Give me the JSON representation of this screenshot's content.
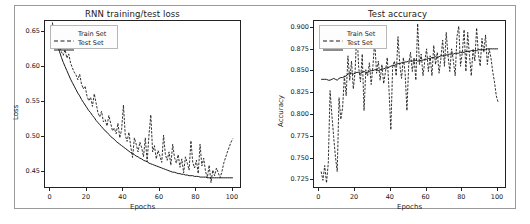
{
  "figure": {
    "background": "#ffffff",
    "border_color": "#9a9a9a",
    "line_color": "#1a1a1a"
  },
  "charts": [
    {
      "id": "loss-chart",
      "title": "RNN training/test loss",
      "xlabel": "Epochs",
      "ylabel": "Loss",
      "xticks": [
        "0",
        "20",
        "40",
        "60",
        "80",
        "100"
      ],
      "yticks": [
        "0.65",
        "0.60",
        "0.55",
        "0.50",
        "0.45"
      ],
      "legend": [
        {
          "label": "Train Set",
          "style": "dashed"
        },
        {
          "label": "Test Set",
          "style": "solid"
        }
      ]
    },
    {
      "id": "accuracy-chart",
      "title": "Test accuracy",
      "xlabel": "Epochs",
      "ylabel": "Accuracy",
      "xticks": [
        "0",
        "20",
        "40",
        "60",
        "80",
        "100"
      ],
      "yticks": [
        "0.900",
        "0.875",
        "0.850",
        "0.825",
        "0.800",
        "0.775",
        "0.750",
        "0.725"
      ],
      "legend": [
        {
          "label": "Train Set",
          "style": "dashed"
        },
        {
          "label": "Test Set",
          "style": "solid"
        }
      ]
    }
  ],
  "chart_data": [
    {
      "type": "line",
      "title": "RNN training/test loss",
      "xlabel": "Epochs",
      "ylabel": "Loss",
      "xlim": [
        -3,
        105
      ],
      "ylim": [
        0.425,
        0.665
      ],
      "grid": false,
      "legend_position": "upper left",
      "x": [
        1,
        2,
        3,
        4,
        5,
        6,
        7,
        8,
        9,
        10,
        11,
        12,
        13,
        14,
        15,
        16,
        17,
        18,
        19,
        20,
        21,
        22,
        23,
        24,
        25,
        26,
        27,
        28,
        29,
        30,
        31,
        32,
        33,
        34,
        35,
        36,
        37,
        38,
        39,
        40,
        41,
        42,
        43,
        44,
        45,
        46,
        47,
        48,
        49,
        50,
        51,
        52,
        53,
        54,
        55,
        56,
        57,
        58,
        59,
        60,
        61,
        62,
        63,
        64,
        65,
        66,
        67,
        68,
        69,
        70,
        71,
        72,
        73,
        74,
        75,
        76,
        77,
        78,
        79,
        80,
        81,
        82,
        83,
        84,
        85,
        86,
        87,
        88,
        89,
        90,
        91,
        92,
        93,
        94,
        95,
        96,
        97,
        98,
        99,
        100
      ],
      "series": [
        {
          "name": "Train Set",
          "style": "dashed",
          "values": [
            0.663,
            0.651,
            0.642,
            0.634,
            0.627,
            0.621,
            0.616,
            0.624,
            0.612,
            0.618,
            0.605,
            0.598,
            0.592,
            0.588,
            0.581,
            0.589,
            0.575,
            0.568,
            0.572,
            0.558,
            0.551,
            0.556,
            0.543,
            0.561,
            0.548,
            0.534,
            0.528,
            0.536,
            0.521,
            0.524,
            0.515,
            0.53,
            0.519,
            0.508,
            0.512,
            0.504,
            0.519,
            0.498,
            0.51,
            0.545,
            0.502,
            0.493,
            0.506,
            0.486,
            0.47,
            0.498,
            0.489,
            0.478,
            0.492,
            0.484,
            0.471,
            0.498,
            0.464,
            0.502,
            0.531,
            0.478,
            0.487,
            0.468,
            0.48,
            0.472,
            0.463,
            0.502,
            0.474,
            0.466,
            0.478,
            0.459,
            0.489,
            0.47,
            0.462,
            0.474,
            0.456,
            0.468,
            0.448,
            0.471,
            0.462,
            0.452,
            0.494,
            0.463,
            0.455,
            0.466,
            0.447,
            0.489,
            0.458,
            0.469,
            0.45,
            0.441,
            0.459,
            0.434,
            0.452,
            0.444,
            0.455,
            0.448,
            0.441,
            0.45,
            0.462,
            0.47,
            0.478,
            0.485,
            0.492,
            0.497
          ]
        },
        {
          "name": "Test Set",
          "style": "solid",
          "values": [
            0.66,
            0.648,
            0.638,
            0.629,
            0.621,
            0.613,
            0.606,
            0.6,
            0.594,
            0.588,
            0.582,
            0.577,
            0.572,
            0.567,
            0.562,
            0.558,
            0.553,
            0.549,
            0.545,
            0.541,
            0.537,
            0.534,
            0.53,
            0.527,
            0.523,
            0.52,
            0.517,
            0.514,
            0.511,
            0.508,
            0.506,
            0.503,
            0.5,
            0.498,
            0.496,
            0.493,
            0.491,
            0.489,
            0.487,
            0.485,
            0.483,
            0.481,
            0.479,
            0.477,
            0.476,
            0.474,
            0.472,
            0.471,
            0.469,
            0.468,
            0.466,
            0.465,
            0.464,
            0.462,
            0.461,
            0.46,
            0.459,
            0.458,
            0.457,
            0.456,
            0.455,
            0.454,
            0.453,
            0.452,
            0.451,
            0.45,
            0.449,
            0.449,
            0.448,
            0.447,
            0.447,
            0.446,
            0.446,
            0.445,
            0.445,
            0.444,
            0.444,
            0.444,
            0.443,
            0.443,
            0.443,
            0.442,
            0.442,
            0.442,
            0.442,
            0.441,
            0.441,
            0.441,
            0.441,
            0.441,
            0.441,
            0.441,
            0.441,
            0.441,
            0.441,
            0.441,
            0.441,
            0.441,
            0.441,
            0.441
          ]
        }
      ]
    },
    {
      "type": "line",
      "title": "Test accuracy",
      "xlabel": "Epochs",
      "ylabel": "Accuracy",
      "xlim": [
        -3,
        105
      ],
      "ylim": [
        0.715,
        0.908
      ],
      "grid": false,
      "legend_position": "upper left",
      "x": [
        1,
        2,
        3,
        4,
        5,
        6,
        7,
        8,
        9,
        10,
        11,
        12,
        13,
        14,
        15,
        16,
        17,
        18,
        19,
        20,
        21,
        22,
        23,
        24,
        25,
        26,
        27,
        28,
        29,
        30,
        31,
        32,
        33,
        34,
        35,
        36,
        37,
        38,
        39,
        40,
        41,
        42,
        43,
        44,
        45,
        46,
        47,
        48,
        49,
        50,
        51,
        52,
        53,
        54,
        55,
        56,
        57,
        58,
        59,
        60,
        61,
        62,
        63,
        64,
        65,
        66,
        67,
        68,
        69,
        70,
        71,
        72,
        73,
        74,
        75,
        76,
        77,
        78,
        79,
        80,
        81,
        82,
        83,
        84,
        85,
        86,
        87,
        88,
        89,
        90,
        91,
        92,
        93,
        94,
        95,
        96,
        97,
        98,
        99,
        100
      ],
      "series": [
        {
          "name": "Train Set",
          "style": "dashed",
          "values": [
            0.735,
            0.725,
            0.742,
            0.722,
            0.745,
            0.828,
            0.8,
            0.775,
            0.752,
            0.735,
            0.82,
            0.795,
            0.808,
            0.845,
            0.822,
            0.868,
            0.84,
            0.862,
            0.83,
            0.85,
            0.898,
            0.855,
            0.838,
            0.87,
            0.805,
            0.852,
            0.845,
            0.86,
            0.835,
            0.857,
            0.885,
            0.848,
            0.862,
            0.84,
            0.858,
            0.836,
            0.85,
            0.866,
            0.828,
            0.783,
            0.855,
            0.862,
            0.845,
            0.89,
            0.858,
            0.842,
            0.866,
            0.848,
            0.805,
            0.858,
            0.872,
            0.85,
            0.866,
            0.84,
            0.905,
            0.858,
            0.87,
            0.845,
            0.862,
            0.876,
            0.85,
            0.868,
            0.845,
            0.88,
            0.858,
            0.872,
            0.848,
            0.865,
            0.886,
            0.856,
            0.895,
            0.868,
            0.85,
            0.876,
            0.862,
            0.845,
            0.89,
            0.902,
            0.856,
            0.872,
            0.898,
            0.85,
            0.895,
            0.868,
            0.845,
            0.876,
            0.862,
            0.9,
            0.87,
            0.856,
            0.888,
            0.872,
            0.892,
            0.858,
            0.876,
            0.866,
            0.85,
            0.838,
            0.822,
            0.815
          ]
        },
        {
          "name": "Test Set",
          "style": "solid",
          "values": [
            0.841,
            0.841,
            0.841,
            0.841,
            0.84,
            0.84,
            0.841,
            0.842,
            0.841,
            0.84,
            0.842,
            0.843,
            0.843,
            0.844,
            0.845,
            0.847,
            0.848,
            0.848,
            0.847,
            0.848,
            0.849,
            0.849,
            0.848,
            0.849,
            0.85,
            0.849,
            0.849,
            0.85,
            0.851,
            0.851,
            0.852,
            0.852,
            0.851,
            0.852,
            0.853,
            0.853,
            0.854,
            0.854,
            0.855,
            0.856,
            0.857,
            0.857,
            0.858,
            0.859,
            0.859,
            0.86,
            0.86,
            0.861,
            0.861,
            0.862,
            0.862,
            0.862,
            0.862,
            0.863,
            0.862,
            0.862,
            0.863,
            0.863,
            0.864,
            0.864,
            0.865,
            0.865,
            0.866,
            0.866,
            0.867,
            0.866,
            0.867,
            0.868,
            0.868,
            0.868,
            0.869,
            0.869,
            0.87,
            0.87,
            0.87,
            0.871,
            0.871,
            0.871,
            0.872,
            0.872,
            0.872,
            0.873,
            0.873,
            0.873,
            0.874,
            0.874,
            0.874,
            0.874,
            0.875,
            0.875,
            0.875,
            0.875,
            0.875,
            0.876,
            0.876,
            0.876,
            0.876,
            0.876,
            0.876,
            0.876
          ]
        }
      ]
    }
  ]
}
